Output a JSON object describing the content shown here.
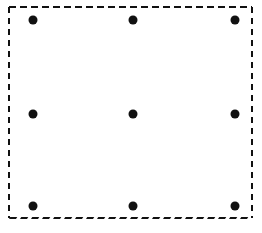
{
  "figure": {
    "canvas": {
      "width": 262,
      "height": 233,
      "background_color": "#ffffff"
    },
    "border": {
      "shape": "rectangle",
      "style": "dashed",
      "color": "#111111",
      "stroke_width": 2,
      "left": 9,
      "top": 7,
      "right": 252,
      "bottom": 218,
      "dash_horizontal": "7 4",
      "dash_vertical": "6 5",
      "bottom_dash_style": "slanted",
      "bottom_dash_skew_deg": -20
    },
    "dots": {
      "color": "#111111",
      "diameter": 9,
      "rows": 3,
      "columns": 3,
      "count": 9,
      "column_x": [
        33,
        133,
        235
      ],
      "row_y": [
        20,
        114,
        206
      ],
      "items": [
        {
          "label": "dot-row1-col1",
          "x": 33,
          "y": 20
        },
        {
          "label": "dot-row1-col2",
          "x": 133,
          "y": 20
        },
        {
          "label": "dot-row1-col3",
          "x": 235,
          "y": 20
        },
        {
          "label": "dot-row2-col1",
          "x": 33,
          "y": 114
        },
        {
          "label": "dot-row2-col2",
          "x": 133,
          "y": 114
        },
        {
          "label": "dot-row2-col3",
          "x": 235,
          "y": 114
        },
        {
          "label": "dot-row3-col1",
          "x": 33,
          "y": 206
        },
        {
          "label": "dot-row3-col2",
          "x": 133,
          "y": 206
        },
        {
          "label": "dot-row3-col3",
          "x": 235,
          "y": 206
        }
      ]
    }
  }
}
